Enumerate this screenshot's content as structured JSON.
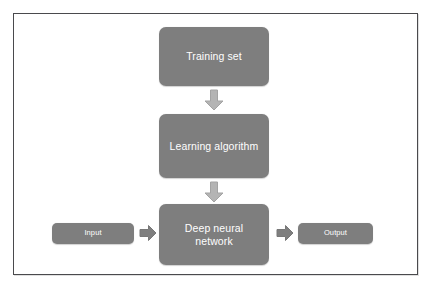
{
  "diagram": {
    "type": "flowchart",
    "colors": {
      "node_fill": "#7e7e7e",
      "node_text": "#ffffff",
      "frame_border": "#4a4a4d",
      "background": "#ffffff",
      "arrow_down_fill": "#b4b4b4",
      "arrow_right_fill": "#7f7f7f"
    },
    "nodes": [
      {
        "id": "training-set",
        "label": "Training set"
      },
      {
        "id": "learning-algorithm",
        "label": "Learning algorithm"
      },
      {
        "id": "deep-neural-network",
        "label": "Deep neural\nnetwork"
      },
      {
        "id": "input",
        "label": "Input"
      },
      {
        "id": "output",
        "label": "Output"
      }
    ],
    "arrows": [
      {
        "id": "training-to-learning",
        "direction": "down",
        "from": "training-set",
        "to": "learning-algorithm"
      },
      {
        "id": "learning-to-network",
        "direction": "down",
        "from": "learning-algorithm",
        "to": "deep-neural-network"
      },
      {
        "id": "input-to-network",
        "direction": "right",
        "from": "input",
        "to": "deep-neural-network"
      },
      {
        "id": "network-to-output",
        "direction": "right",
        "from": "deep-neural-network",
        "to": "output"
      }
    ]
  }
}
